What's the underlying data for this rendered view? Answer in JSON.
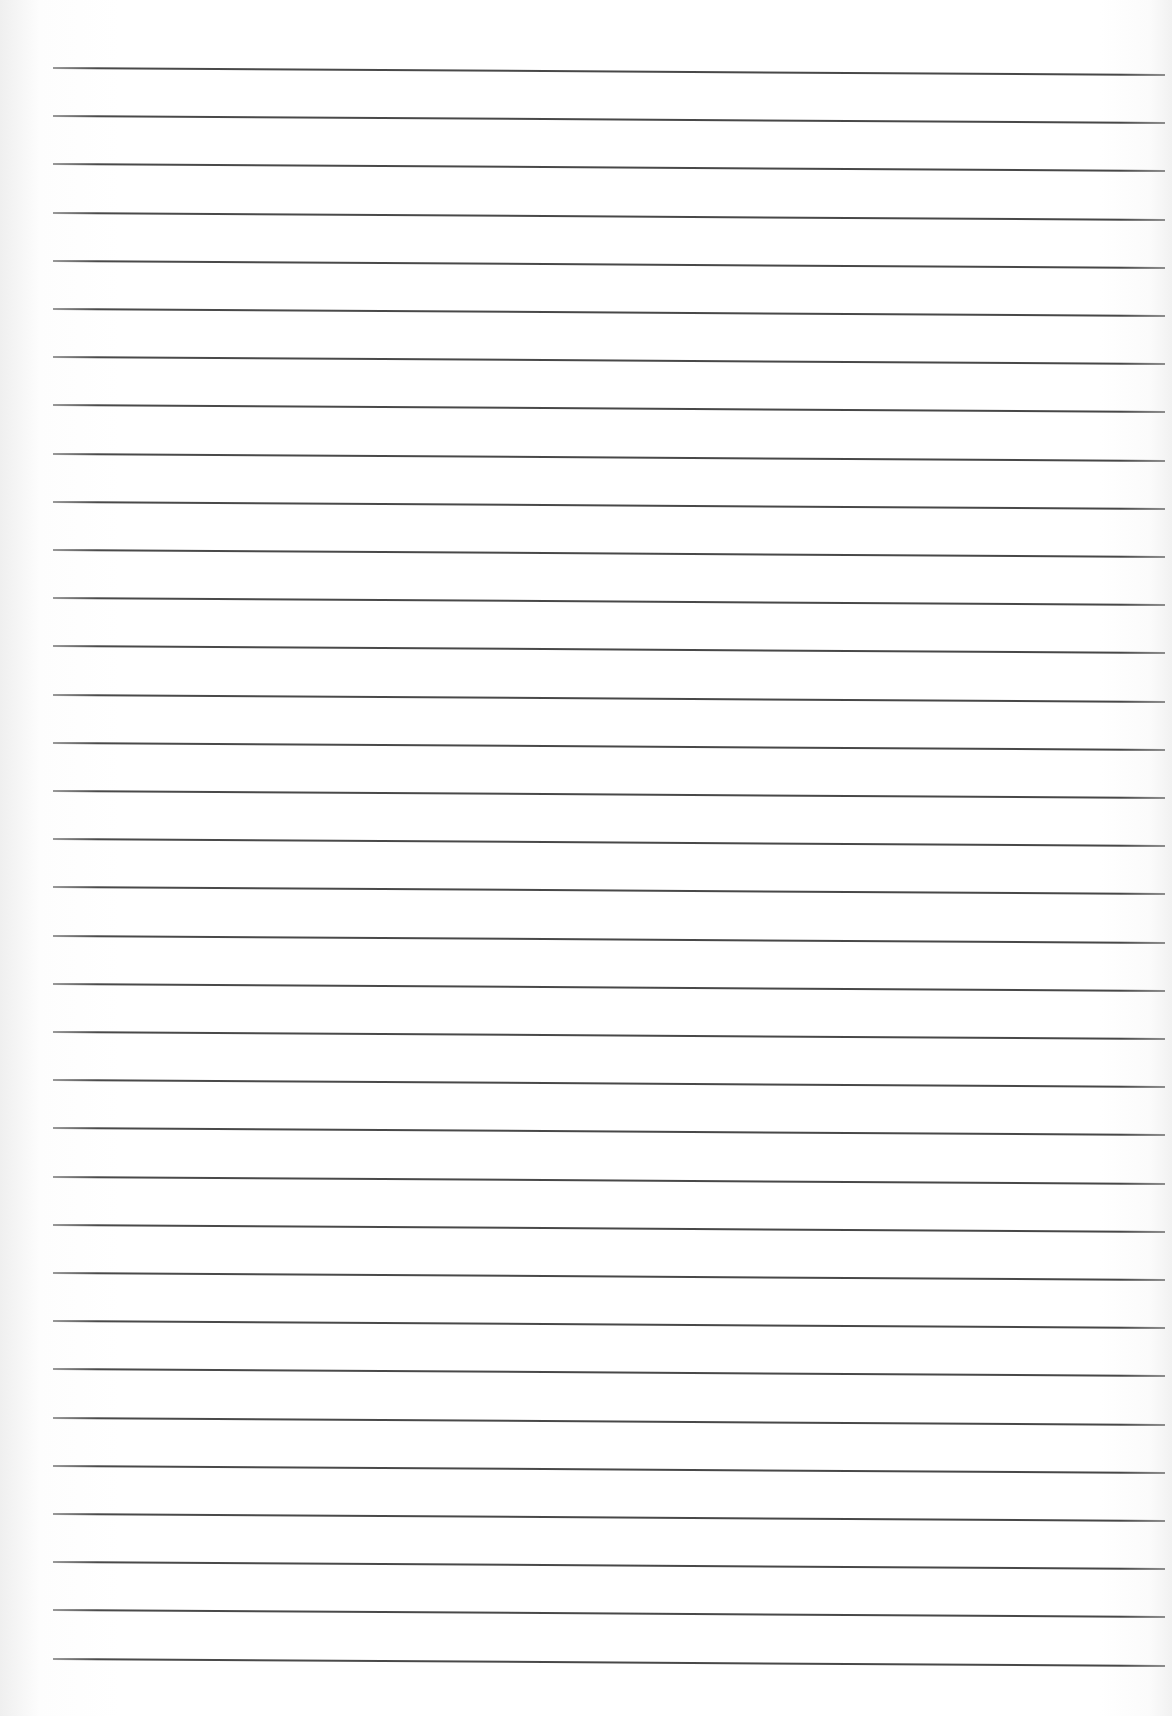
{
  "page": {
    "type": "ruled-paper",
    "background_color": "#ffffff",
    "rule_color": "#4a4a4a",
    "rule_count": 34,
    "first_rule_y": 67,
    "rule_spacing": 48.2,
    "rule_left_x": 53,
    "rule_right_x": 1165
  }
}
